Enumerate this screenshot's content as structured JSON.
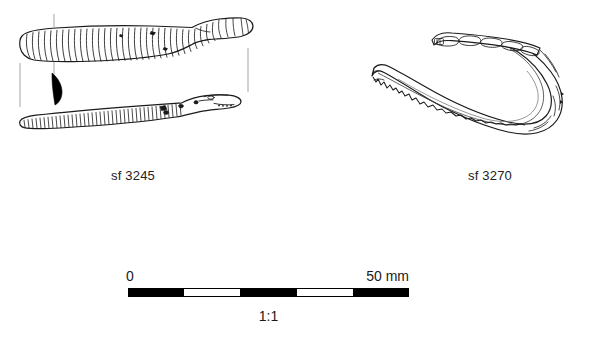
{
  "plate": {
    "background_color": "#ffffff",
    "ink_color": "#1a1a1a",
    "description": "Archaeological finds illustration: two drawn objects with small-find numbers and a metric scale bar"
  },
  "figures": [
    {
      "id": "sf-3245",
      "label": "sf 3245",
      "views": [
        "plan view (ribbed/coiled shaft with rounded terminal)",
        "profile view (ribbed shaft with expanded head)",
        "cross-section (solid black D-shape)"
      ],
      "cross_section_fill": "#000000"
    },
    {
      "id": "sf-3270",
      "label": "sf 3270",
      "views": [
        "side view of curved band / hooked strip with notched edge"
      ],
      "cross_section_fill": null
    }
  ],
  "scale": {
    "zero_label": "0",
    "max_label": "50 mm",
    "ratio_label": "1:1",
    "segments": [
      "dark",
      "light",
      "dark",
      "light",
      "dark"
    ],
    "segment_count": 5,
    "segment_value_mm": 10,
    "total_mm": 50,
    "bar_color_dark": "#000000",
    "bar_color_light": "#ffffff"
  }
}
